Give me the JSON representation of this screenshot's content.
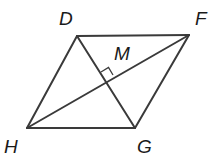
{
  "diagram": {
    "type": "rhombus-with-diagonals",
    "line_color": "#3a3a3a",
    "vertices": {
      "D": {
        "label": "D",
        "x": 77,
        "y": 36
      },
      "F": {
        "label": "F",
        "x": 189,
        "y": 35
      },
      "G": {
        "label": "G",
        "x": 135,
        "y": 128
      },
      "H": {
        "label": "H",
        "x": 27,
        "y": 128
      }
    },
    "intersection": {
      "label": "M",
      "x": 107,
      "y": 82
    },
    "sides": [
      "DF",
      "FG",
      "GH",
      "HD"
    ],
    "diagonals": [
      "HF",
      "DG"
    ],
    "right_angle_at": "M"
  }
}
